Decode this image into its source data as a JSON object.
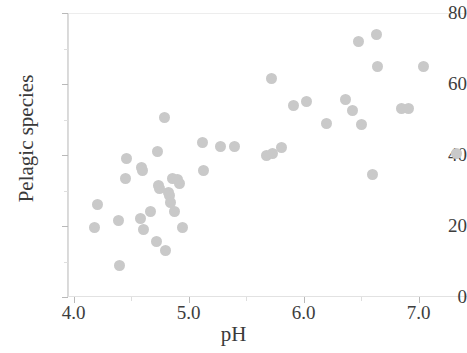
{
  "chart_data": {
    "type": "scatter",
    "title": "",
    "xlabel": "pH",
    "ylabel": "Pelagic species",
    "xlim": [
      3.95,
      7.42
    ],
    "ylim": [
      0,
      80
    ],
    "xticks": [
      4.0,
      5.0,
      6.0,
      7.0
    ],
    "xtick_labels": [
      "4.0",
      "5.0",
      "6.0",
      "7.0"
    ],
    "yticks": [
      0,
      20,
      40,
      60,
      80
    ],
    "ytick_labels": [
      "0",
      "20",
      "40",
      "60",
      "80"
    ],
    "x_minor_ticks": [
      4.5,
      5.5,
      6.5
    ],
    "y_minor_ticks": [
      10,
      30,
      50,
      70
    ],
    "grid": false,
    "legend": "none",
    "marker": {
      "shape": "circle",
      "color": "#c9c9c9",
      "size_px": 11
    },
    "n_points": 57,
    "points": [
      {
        "x": 4.21,
        "y": 26.0
      },
      {
        "x": 4.18,
        "y": 19.5
      },
      {
        "x": 4.39,
        "y": 21.5
      },
      {
        "x": 4.4,
        "y": 9.0
      },
      {
        "x": 4.46,
        "y": 39.0
      },
      {
        "x": 4.45,
        "y": 33.5
      },
      {
        "x": 4.58,
        "y": 22.0
      },
      {
        "x": 4.59,
        "y": 36.5
      },
      {
        "x": 4.6,
        "y": 35.5
      },
      {
        "x": 4.61,
        "y": 19.0
      },
      {
        "x": 4.67,
        "y": 24.0
      },
      {
        "x": 4.72,
        "y": 15.5
      },
      {
        "x": 4.73,
        "y": 41.0
      },
      {
        "x": 4.74,
        "y": 31.5
      },
      {
        "x": 4.75,
        "y": 30.5
      },
      {
        "x": 4.79,
        "y": 50.5
      },
      {
        "x": 4.8,
        "y": 13.0
      },
      {
        "x": 4.82,
        "y": 29.5
      },
      {
        "x": 4.83,
        "y": 28.5
      },
      {
        "x": 4.84,
        "y": 26.5
      },
      {
        "x": 4.86,
        "y": 33.5
      },
      {
        "x": 4.88,
        "y": 24.0
      },
      {
        "x": 4.9,
        "y": 33.0
      },
      {
        "x": 4.92,
        "y": 32.0
      },
      {
        "x": 4.95,
        "y": 19.5
      },
      {
        "x": 5.12,
        "y": 43.5
      },
      {
        "x": 5.13,
        "y": 35.5
      },
      {
        "x": 5.28,
        "y": 42.5
      },
      {
        "x": 5.4,
        "y": 42.5
      },
      {
        "x": 5.68,
        "y": 40.0
      },
      {
        "x": 5.73,
        "y": 40.5
      },
      {
        "x": 5.72,
        "y": 61.5
      },
      {
        "x": 5.81,
        "y": 42.0
      },
      {
        "x": 5.91,
        "y": 54.0
      },
      {
        "x": 6.02,
        "y": 55.0
      },
      {
        "x": 6.2,
        "y": 49.0
      },
      {
        "x": 6.36,
        "y": 55.5
      },
      {
        "x": 6.42,
        "y": 52.5
      },
      {
        "x": 6.48,
        "y": 72.0
      },
      {
        "x": 6.5,
        "y": 48.5
      },
      {
        "x": 6.63,
        "y": 74.0
      },
      {
        "x": 6.64,
        "y": 65.0
      },
      {
        "x": 6.6,
        "y": 34.5
      },
      {
        "x": 6.85,
        "y": 53.0
      },
      {
        "x": 6.91,
        "y": 53.0
      },
      {
        "x": 7.04,
        "y": 65.0
      },
      {
        "x": 7.33,
        "y": 40.5
      }
    ]
  },
  "axes": {
    "x_title": "pH",
    "y_title": "Pelagic species"
  }
}
